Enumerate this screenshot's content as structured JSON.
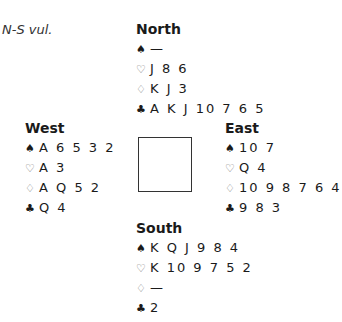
{
  "vulnerability": "N-S vul.",
  "hands": {
    "north": {
      "name": "North",
      "spades": "—",
      "hearts": "J 8 6",
      "diamonds": "K J 3",
      "clubs": "A K J 10 7 6 5"
    },
    "west": {
      "name": "West",
      "spades": "A 6 5 3 2",
      "hearts": "A 3",
      "diamonds": "A Q 5 2",
      "clubs": "Q 4"
    },
    "east": {
      "name": "East",
      "spades": "10 7",
      "hearts": "Q 4",
      "diamonds": "10 9 8 7 6 4",
      "clubs": "9 8 3"
    },
    "south": {
      "name": "South",
      "spades": "K Q J 9 8 4",
      "hearts": "K 10 9 7 5 2",
      "diamonds": "—",
      "clubs": "2"
    }
  },
  "suit_symbols": {
    "spades": "♠",
    "hearts": "♡",
    "diamonds": "♢",
    "clubs": "♣"
  }
}
